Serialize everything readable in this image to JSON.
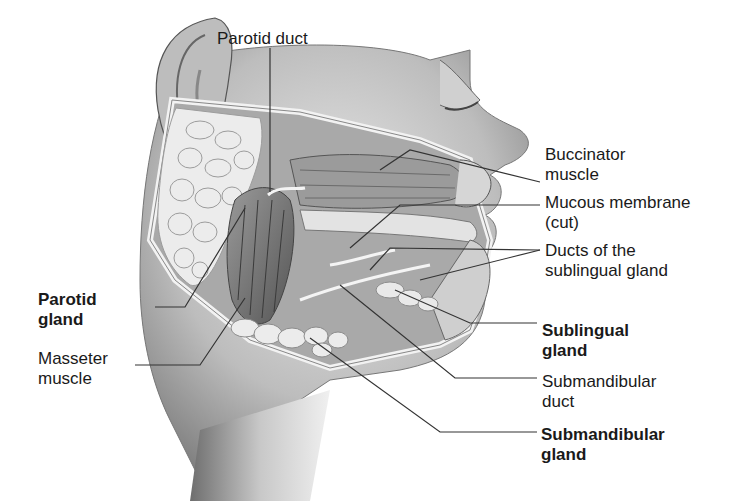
{
  "figure": {
    "labels": {
      "parotid_duct": "Parotid duct",
      "buccinator": [
        "Buccinator",
        "muscle"
      ],
      "mucous_membrane": [
        "Mucous membrane",
        "(cut)"
      ],
      "ducts_sublingual": [
        "Ducts of the",
        "sublingual gland"
      ],
      "parotid_gland": [
        "Parotid",
        "gland"
      ],
      "masseter": [
        "Masseter",
        "muscle"
      ],
      "sublingual_gland": [
        "Sublingual",
        "gland"
      ],
      "submandibular_duct": [
        "Submandibular",
        "duct"
      ],
      "submandibular_gland": [
        "Submandibular",
        "gland"
      ]
    },
    "colors": {
      "line": "#333333",
      "skin": "#cfcfcf",
      "gland": "#e6e6e6",
      "muscle": "#8a8a8a"
    }
  }
}
